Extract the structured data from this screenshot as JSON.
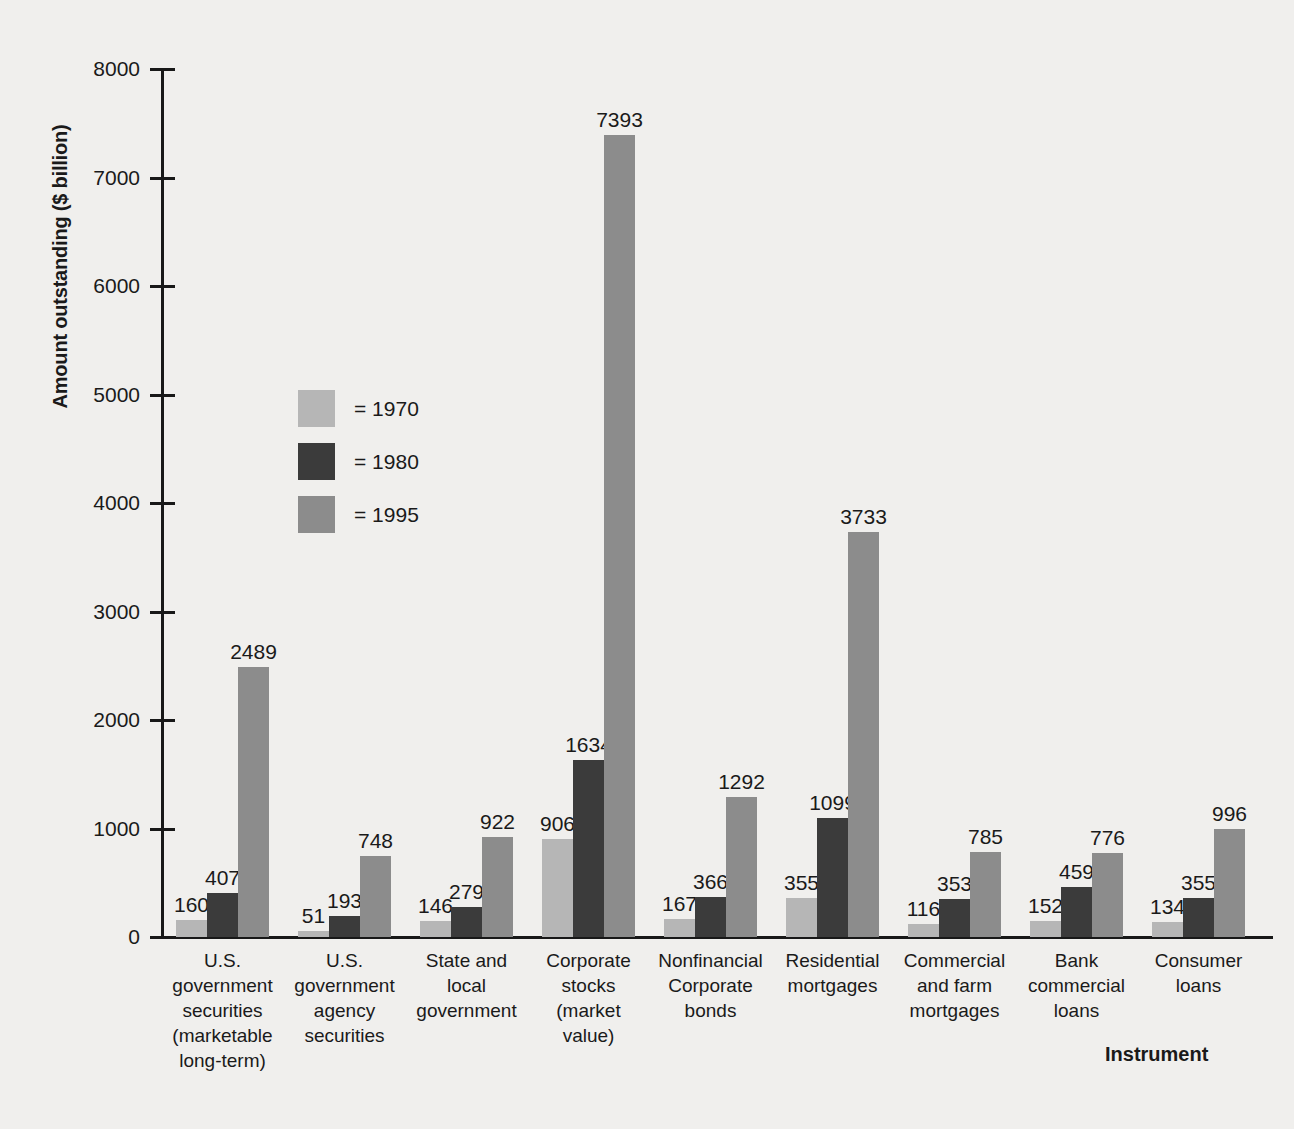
{
  "chart_data": {
    "type": "bar",
    "title": "",
    "xlabel": "Instrument",
    "ylabel": "Amount outstanding ($ billion)",
    "ylim": [
      0,
      8000
    ],
    "ytick_labels": [
      "8000",
      "7000",
      "6000",
      "5000",
      "4000",
      "3000",
      "2000",
      "1000",
      "0"
    ],
    "yticks": [
      8000,
      7000,
      6000,
      5000,
      4000,
      3000,
      2000,
      1000,
      0
    ],
    "grid": false,
    "legend_position": "inside-upper-left",
    "categories": [
      "U.S. government securities (marketable long-term)",
      "U.S. government agency securities",
      "State and local government",
      "Corporate stocks (market value)",
      "Nonfinancial Corporate bonds",
      "Residential mortgages",
      "Commercial and farm mortgages",
      "Bank commercial loans",
      "Consumer loans"
    ],
    "category_lines": [
      [
        "U.S.",
        "government",
        "securities",
        "(marketable",
        "long-term)"
      ],
      [
        "U.S.",
        "government",
        "agency",
        "securities"
      ],
      [
        "State and",
        "local",
        "government"
      ],
      [
        "Corporate",
        "stocks",
        "(market",
        "value)"
      ],
      [
        "Nonfinancial",
        "Corporate",
        "bonds"
      ],
      [
        "Residential",
        "mortgages"
      ],
      [
        "Commercial",
        "and farm",
        "mortgages"
      ],
      [
        "Bank",
        "commercial",
        "loans"
      ],
      [
        "Consumer",
        "loans"
      ]
    ],
    "series": [
      {
        "name": "1970",
        "color": "#b6b6b6",
        "values": [
          160,
          51,
          146,
          906,
          167,
          355,
          116,
          152,
          134
        ]
      },
      {
        "name": "1980",
        "color": "#3b3b3b",
        "values": [
          407,
          193,
          279,
          1634,
          366,
          1099,
          353,
          459,
          355
        ]
      },
      {
        "name": "1995",
        "color": "#8c8c8c",
        "values": [
          2489,
          748,
          922,
          7393,
          1292,
          3733,
          785,
          776,
          996
        ]
      }
    ]
  },
  "legend": {
    "items": [
      {
        "label": "= 1970",
        "color": "#b6b6b6"
      },
      {
        "label": "= 1980",
        "color": "#3b3b3b"
      },
      {
        "label": "= 1995",
        "color": "#8c8c8c"
      }
    ]
  },
  "colors": {
    "background": "#f0efed",
    "axis": "#181818",
    "text": "#1a1a1a",
    "series_1970": "#b6b6b6",
    "series_1980": "#3b3b3b",
    "series_1995": "#8c8c8c"
  }
}
